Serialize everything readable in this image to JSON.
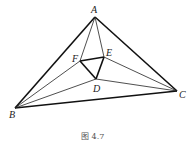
{
  "figure": {
    "caption": "图  4.7",
    "points": {
      "A": {
        "label": "A",
        "x": 95,
        "y": 17
      },
      "B": {
        "label": "B",
        "x": 15,
        "y": 108
      },
      "C": {
        "label": "C",
        "x": 177,
        "y": 91
      },
      "D": {
        "label": "D",
        "x": 96,
        "y": 79
      },
      "E": {
        "label": "E",
        "x": 104,
        "y": 57
      },
      "F": {
        "label": "F",
        "x": 80,
        "y": 61
      }
    },
    "thick_segments": [
      "AB",
      "BC",
      "CA",
      "DE",
      "EF",
      "FD"
    ],
    "thin_segments": [
      "AF",
      "AE",
      "BF",
      "BD",
      "CE",
      "CD"
    ]
  }
}
